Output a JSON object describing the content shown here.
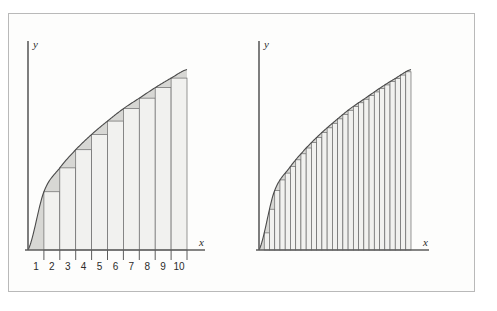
{
  "figure": {
    "title": "",
    "caption": "",
    "background_color": "#fdfdfc",
    "frame_color": "#b9b9b9"
  },
  "colors": {
    "axis": "#5d5d5d",
    "curve": "#4a4a4a",
    "rect_fill": "#f1f1ef",
    "rect_stroke": "#6a6a6a",
    "area_fill": "#d7d7d4",
    "text": "#2b2b2b"
  },
  "chart_data": [
    {
      "id": "left-panel",
      "type": "area",
      "title": "",
      "xlabel": "x",
      "ylabel": "y",
      "grid": false,
      "legend": null,
      "n_rectangles": 9,
      "rectangle_rule": "left-endpoint lower sum (inscribed)",
      "xlim": [
        0,
        10
      ],
      "ylim": [
        0,
        10
      ],
      "xticks": [
        1,
        2,
        3,
        4,
        5,
        6,
        7,
        8,
        9,
        10
      ],
      "xtick_labels": [
        "1",
        "2",
        "3",
        "4",
        "5",
        "6",
        "7",
        "8",
        "9",
        "10"
      ],
      "yticks": [],
      "ytick_labels": [],
      "curve_description": "increasing concave-down curve through the origin",
      "curve_points_x": [
        0,
        1,
        2,
        3,
        4,
        5,
        6,
        7,
        8,
        9,
        10
      ],
      "curve_points_y": [
        0,
        3.05,
        4.3,
        5.25,
        6.05,
        6.75,
        7.4,
        7.95,
        8.5,
        9.0,
        9.45
      ],
      "bar_x_left": [
        1,
        2,
        3,
        4,
        5,
        6,
        7,
        8,
        9
      ],
      "bar_heights": [
        3.05,
        4.3,
        5.25,
        6.05,
        6.75,
        7.4,
        7.95,
        8.5,
        9.0
      ],
      "bar_width": 1
    },
    {
      "id": "right-panel",
      "type": "area",
      "title": "",
      "xlabel": "x",
      "ylabel": "y",
      "grid": false,
      "legend": null,
      "n_rectangles": 29,
      "rectangle_rule": "left-endpoint lower sum (inscribed), finer partition",
      "xlim": [
        0,
        10
      ],
      "ylim": [
        0,
        10
      ],
      "xticks": [],
      "xtick_labels": [],
      "yticks": [],
      "ytick_labels": [],
      "curve_description": "same increasing concave-down curve through the origin",
      "curve_points_x": [
        0,
        1,
        2,
        3,
        4,
        5,
        6,
        7,
        8,
        9,
        10
      ],
      "curve_points_y": [
        0,
        3.05,
        4.3,
        5.25,
        6.05,
        6.75,
        7.4,
        7.95,
        8.5,
        9.0,
        9.45
      ],
      "bar_width": 0.3448
    }
  ],
  "left_panel": {
    "y_axis_label": "y",
    "x_axis_label": "x",
    "tick_labels": [
      "1",
      "2",
      "3",
      "4",
      "5",
      "6",
      "7",
      "8",
      "9",
      "10"
    ]
  },
  "right_panel": {
    "y_axis_label": "y",
    "x_axis_label": "x",
    "tick_labels": []
  }
}
